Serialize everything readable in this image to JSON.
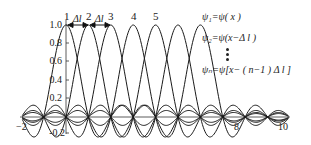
{
  "chart_data": {
    "type": "line",
    "title": "",
    "xlabel": "",
    "ylabel": "",
    "xlim": [
      -2,
      10
    ],
    "ylim": [
      -0.2,
      1.0
    ],
    "grid": false,
    "x_ticks": [
      "-2",
      "8",
      "10"
    ],
    "y_ticks": [
      "1.0",
      "0.8",
      "0.6",
      "0.4",
      "0.2",
      "-0.2"
    ],
    "function": "sinc: psi(x) = sin(pi x)/(pi x)",
    "shift": 1,
    "series": [
      {
        "name": "1",
        "peak_x": 0,
        "peak_y": 1.0
      },
      {
        "name": "2",
        "peak_x": 1,
        "peak_y": 1.0
      },
      {
        "name": "3",
        "peak_x": 2,
        "peak_y": 1.0
      },
      {
        "name": "4",
        "peak_x": 3,
        "peak_y": 1.0
      },
      {
        "name": "5",
        "peak_x": 4,
        "peak_y": 1.0
      },
      {
        "name": "6",
        "peak_x": 5,
        "peak_y": 1.0
      },
      {
        "name": "7",
        "peak_x": 6,
        "peak_y": 1.0
      }
    ],
    "peak_labels": [
      "1",
      "2",
      "3",
      "4",
      "5"
    ],
    "annotations": [
      "Δl",
      "Δl"
    ],
    "legend": [
      "ψ1=ψ(x)",
      "ψ2=ψ(x−Δl)",
      "⋮",
      "ψn=ψ[x−(n−1)Δl]"
    ],
    "legend_position": "upper right"
  },
  "labels": {
    "y_ticks": [
      "1.0",
      "0.8",
      "0.6",
      "0.4",
      "0.2",
      "-0.2"
    ],
    "x_ticks": [
      "−2",
      "8",
      "10"
    ],
    "peaks": [
      "1",
      "2",
      "3",
      "4",
      "5"
    ],
    "delta": "Δl",
    "legend": {
      "l1": "ψ₁=ψ( x )",
      "l2": "ψ₂=ψ(x−Δ l )",
      "ln": "ψₙ=ψ[x− ( n−1 ) Δ l ]"
    }
  }
}
